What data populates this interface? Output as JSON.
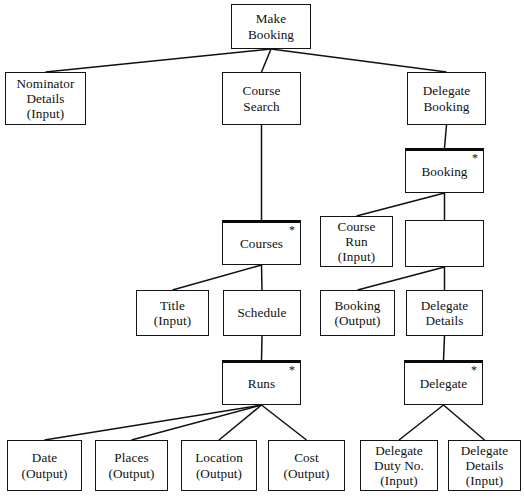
{
  "diagram": {
    "type": "jackson-structure-diagram",
    "iteration_marker": "*",
    "colors": {
      "box_border": "#141414",
      "background": "#ffffff",
      "text": "#101010",
      "edge": "#101010"
    },
    "nodes": [
      {
        "id": "make-booking",
        "label": "Make\nBooking",
        "x": 231,
        "y": 4,
        "w": 80,
        "h": 45,
        "star": false
      },
      {
        "id": "nominator-details",
        "label": "Nominator\nDetails\n(Input)",
        "x": 5,
        "y": 72,
        "w": 81,
        "h": 53,
        "star": false
      },
      {
        "id": "course-search",
        "label": "Course\nSearch",
        "x": 222,
        "y": 72,
        "w": 79,
        "h": 53,
        "star": false
      },
      {
        "id": "delegate-booking",
        "label": "Delegate\nBooking",
        "x": 407,
        "y": 72,
        "w": 79,
        "h": 53,
        "star": false
      },
      {
        "id": "booking",
        "label": "Booking",
        "x": 405,
        "y": 148,
        "w": 79,
        "h": 45,
        "star": true
      },
      {
        "id": "courses",
        "label": "Courses",
        "x": 222,
        "y": 220,
        "w": 79,
        "h": 45,
        "star": true
      },
      {
        "id": "course-run",
        "label": "Course\nRun\n(Input)",
        "x": 320,
        "y": 216,
        "w": 73,
        "h": 51,
        "star": false
      },
      {
        "id": "booking-empty",
        "label": "",
        "x": 405,
        "y": 220,
        "w": 79,
        "h": 47,
        "star": false
      },
      {
        "id": "title",
        "label": "Title\n(Input)",
        "x": 136,
        "y": 290,
        "w": 73,
        "h": 46,
        "star": false
      },
      {
        "id": "schedule",
        "label": "Schedule",
        "x": 223,
        "y": 290,
        "w": 78,
        "h": 46,
        "star": false
      },
      {
        "id": "booking-output",
        "label": "Booking\n(Output)",
        "x": 320,
        "y": 290,
        "w": 75,
        "h": 46,
        "star": false
      },
      {
        "id": "delegate-details",
        "label": "Delegate\nDetails",
        "x": 406,
        "y": 290,
        "w": 77,
        "h": 46,
        "star": false
      },
      {
        "id": "runs",
        "label": "Runs",
        "x": 222,
        "y": 360,
        "w": 79,
        "h": 45,
        "star": true
      },
      {
        "id": "delegate",
        "label": "Delegate",
        "x": 404,
        "y": 360,
        "w": 79,
        "h": 45,
        "star": true
      },
      {
        "id": "date",
        "label": "Date\n(Output)",
        "x": 7,
        "y": 440,
        "w": 75,
        "h": 51,
        "star": false
      },
      {
        "id": "places",
        "label": "Places\n(Output)",
        "x": 95,
        "y": 440,
        "w": 73,
        "h": 51,
        "star": false
      },
      {
        "id": "location",
        "label": "Location\n(Output)",
        "x": 181,
        "y": 440,
        "w": 76,
        "h": 51,
        "star": false
      },
      {
        "id": "cost",
        "label": "Cost\n(Output)",
        "x": 268,
        "y": 440,
        "w": 77,
        "h": 51,
        "star": false
      },
      {
        "id": "delegate-duty-no",
        "label": "Delegate\nDuty No.\n(Input)",
        "x": 360,
        "y": 440,
        "w": 78,
        "h": 51,
        "star": false
      },
      {
        "id": "delegate-details-2",
        "label": "Delegate\nDetails\n(Input)",
        "x": 448,
        "y": 440,
        "w": 73,
        "h": 51,
        "star": false
      }
    ],
    "edges": [
      {
        "from": "make-booking",
        "to": "nominator-details"
      },
      {
        "from": "make-booking",
        "to": "course-search"
      },
      {
        "from": "make-booking",
        "to": "delegate-booking"
      },
      {
        "from": "delegate-booking",
        "to": "booking"
      },
      {
        "from": "booking",
        "to": "course-run"
      },
      {
        "from": "booking",
        "to": "booking-empty"
      },
      {
        "from": "course-search",
        "to": "courses"
      },
      {
        "from": "courses",
        "to": "title"
      },
      {
        "from": "courses",
        "to": "schedule"
      },
      {
        "from": "booking-empty",
        "to": "booking-output"
      },
      {
        "from": "booking-empty",
        "to": "delegate-details"
      },
      {
        "from": "schedule",
        "to": "runs"
      },
      {
        "from": "delegate-details",
        "to": "delegate"
      },
      {
        "from": "runs",
        "to": "date"
      },
      {
        "from": "runs",
        "to": "places"
      },
      {
        "from": "runs",
        "to": "location"
      },
      {
        "from": "runs",
        "to": "cost"
      },
      {
        "from": "delegate",
        "to": "delegate-duty-no"
      },
      {
        "from": "delegate",
        "to": "delegate-details-2"
      }
    ]
  }
}
